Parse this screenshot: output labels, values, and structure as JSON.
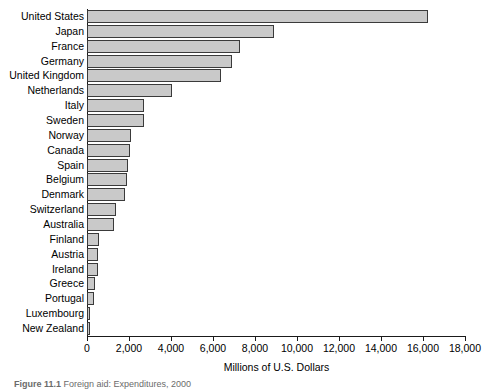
{
  "chart_data": {
    "type": "bar",
    "orientation": "horizontal",
    "title": "",
    "xlabel": "Millions of U.S. Dollars",
    "ylabel": "",
    "xlim": [
      0,
      18000
    ],
    "xtick_step": 2000,
    "xticks": [
      "0",
      "2,000",
      "4,000",
      "6,000",
      "8,000",
      "10,000",
      "12,000",
      "14,000",
      "16,000",
      "18,000"
    ],
    "grid": false,
    "legend": "none",
    "bar_color": "#c9c9c9",
    "bar_edge_color": "#3a3a3a",
    "categories": [
      "United States",
      "Japan",
      "France",
      "Germany",
      "United Kingdom",
      "Netherlands",
      "Italy",
      "Sweden",
      "Norway",
      "Canada",
      "Spain",
      "Belgium",
      "Denmark",
      "Switzerland",
      "Australia",
      "Finland",
      "Austria",
      "Ireland",
      "Greece",
      "Portugal",
      "Luxembourg",
      "New Zealand"
    ],
    "values": [
      16250,
      8900,
      7300,
      6900,
      6400,
      4050,
      2700,
      2700,
      2100,
      2050,
      1950,
      1900,
      1800,
      1400,
      1300,
      560,
      510,
      500,
      400,
      350,
      160,
      140
    ]
  },
  "caption": {
    "label": "Figure 11.1",
    "text": "Foreign aid: Expenditures, 2000"
  }
}
